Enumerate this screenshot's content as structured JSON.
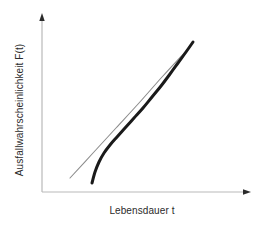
{
  "figure": {
    "background_color": "#ffffff",
    "width": 260,
    "height": 227
  },
  "axes": {
    "y_axis": {
      "label": "Ausfallwahrscheinlichkeit F(t)",
      "name": "y-axis",
      "color": "#b9b9b9",
      "arrow_color": "#2b2b2b",
      "x": 42,
      "y_top": 16,
      "y_bottom": 192
    },
    "x_axis": {
      "label": "Lebensdauer t",
      "name": "x-axis",
      "color": "#b9b9b9",
      "arrow_color": "#2b2b2b",
      "y": 192,
      "x_left": 42,
      "x_right": 250
    }
  },
  "chart_data": {
    "type": "line",
    "title": "",
    "subtitle": "",
    "xlabel": "Lebensdauer t",
    "ylabel": "Ausfallwahrscheinlichkeit F(t)",
    "xlim": [
      42,
      250
    ],
    "ylim": [
      192,
      16
    ],
    "grid": false,
    "legend": false,
    "legend_position": "none",
    "axis_ticks": [],
    "annotations": [],
    "note": "Schematic Weibull-type failure probability plot: a thin straight reference line (two-parameter fit) and a thick curved line (three-parameter / failure-free-time behaviour) that bends away at short lifetimes and becomes asymptotically tangent to the straight line at long lifetimes.",
    "series": [
      {
        "name": "reference-straight-line",
        "style": "thin straight gray line",
        "color": "#8c8c8c",
        "width": 1.1,
        "points": [
          [
            70,
            178
          ],
          [
            93,
            153
          ],
          [
            116,
            128
          ],
          [
            139,
            103
          ],
          [
            162,
            77
          ],
          [
            185,
            52
          ]
        ]
      },
      {
        "name": "curved-failure-probability",
        "style": "thick curved black line",
        "color": "#1a1a1a",
        "width": 3.0,
        "points": [
          [
            92,
            183
          ],
          [
            95,
            172
          ],
          [
            99,
            162
          ],
          [
            104,
            153
          ],
          [
            110,
            145
          ],
          [
            117,
            137
          ],
          [
            125,
            128
          ],
          [
            134,
            118
          ],
          [
            143,
            108
          ],
          [
            152,
            97
          ],
          [
            161,
            86
          ],
          [
            170,
            74
          ],
          [
            178,
            63
          ],
          [
            186,
            52
          ],
          [
            193,
            42
          ]
        ]
      }
    ]
  }
}
